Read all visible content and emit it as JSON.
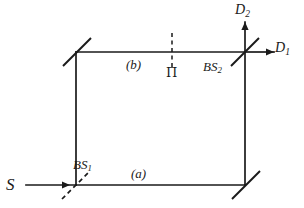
{
  "figure": {
    "name": "mach-zehnder-interferometer-diagram",
    "background_color": "#ffffff",
    "line_color": "#1a1a1a",
    "labels": {
      "source": "S",
      "beam_splitter_1_base": "BS",
      "beam_splitter_1_sub": "1",
      "beam_splitter_2_base": "BS",
      "beam_splitter_2_sub": "2",
      "detector_1_base": "D",
      "detector_1_sub": "1",
      "detector_2_base": "D",
      "detector_2_sub": "2",
      "path_lower": "(a)",
      "path_upper": "(b)",
      "phase_element": "Π"
    },
    "components": [
      {
        "name": "beam-splitter-1",
        "style": "dashed",
        "position": "bottom-left",
        "x": 76,
        "y": 185
      },
      {
        "name": "mirror-top-left",
        "style": "solid",
        "position": "top-left",
        "x": 76,
        "y": 52
      },
      {
        "name": "mirror-bottom-right",
        "style": "solid",
        "position": "bottom-right",
        "x": 245,
        "y": 185
      },
      {
        "name": "beam-splitter-2",
        "style": "solid",
        "position": "top-right",
        "x": 245,
        "y": 52
      },
      {
        "name": "phase-shifter",
        "style": "dashed-vertical",
        "position": "upper-path",
        "x": 172,
        "y": 52
      }
    ],
    "beams": [
      {
        "name": "input-beam",
        "from": "S",
        "to": "BS1",
        "direction": "right"
      },
      {
        "name": "lower-path-a",
        "from": "BS1",
        "to": "mirror-bottom-right",
        "direction": "right"
      },
      {
        "name": "left-vertical-path",
        "from": "BS1",
        "to": "mirror-top-left",
        "direction": "up"
      },
      {
        "name": "upper-path-b",
        "from": "mirror-top-left",
        "to": "BS2",
        "direction": "right"
      },
      {
        "name": "right-vertical-path",
        "from": "mirror-bottom-right",
        "to": "BS2",
        "direction": "up"
      },
      {
        "name": "output-beam-d1",
        "from": "BS2",
        "to": "D1",
        "direction": "right"
      },
      {
        "name": "output-beam-d2",
        "from": "BS2",
        "to": "D2",
        "direction": "up"
      }
    ]
  }
}
